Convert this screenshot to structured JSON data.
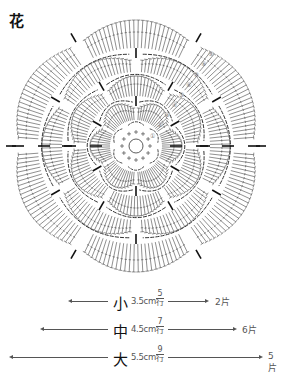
{
  "title": "花",
  "diagram": {
    "row_markers": [
      "①",
      "②",
      "③",
      "④",
      "⑤",
      "⑥",
      "⑦",
      "⑧",
      "⑨"
    ],
    "symmetry": 6
  },
  "legend": {
    "rows": [
      {
        "size": "小",
        "dimension": "3.5cm",
        "rows_num": "5",
        "rows_unit": "行",
        "pieces": "2片"
      },
      {
        "size": "中",
        "dimension": "4.5cm",
        "rows_num": "7",
        "rows_unit": "行",
        "pieces": "6片"
      },
      {
        "size": "大",
        "dimension": "5.5cm",
        "rows_num": "9",
        "rows_unit": "行",
        "pieces": "5片"
      }
    ]
  }
}
